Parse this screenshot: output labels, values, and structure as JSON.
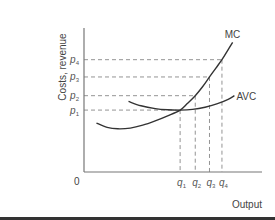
{
  "chart_data": {
    "type": "line",
    "title": "",
    "xlabel": "Output",
    "ylabel": "Costs, revenue",
    "origin_label": "0",
    "grid": false,
    "legend": "none",
    "xlim": [
      0,
      10
    ],
    "ylim": [
      0,
      10
    ],
    "x_ticks": [
      {
        "name": "q",
        "sub": "1",
        "value": 5.4
      },
      {
        "name": "q",
        "sub": "2",
        "value": 6.25
      },
      {
        "name": "q",
        "sub": "3",
        "value": 7.05
      },
      {
        "name": "q",
        "sub": "4",
        "value": 7.75
      }
    ],
    "y_ticks": [
      {
        "name": "p",
        "sub": "1",
        "value": 4.3
      },
      {
        "name": "p",
        "sub": "2",
        "value": 5.3
      },
      {
        "name": "p",
        "sub": "3",
        "value": 6.6
      },
      {
        "name": "p",
        "sub": "4",
        "value": 7.8
      }
    ],
    "series": [
      {
        "name": "MC",
        "label": "MC",
        "points": [
          [
            0.7,
            3.4
          ],
          [
            1.3,
            3.1
          ],
          [
            1.9,
            3.0
          ],
          [
            2.6,
            3.05
          ],
          [
            3.3,
            3.25
          ],
          [
            4.0,
            3.55
          ],
          [
            4.7,
            3.9
          ],
          [
            5.4,
            4.3
          ],
          [
            5.8,
            4.75
          ],
          [
            6.25,
            5.3
          ],
          [
            6.65,
            5.9
          ],
          [
            7.05,
            6.6
          ],
          [
            7.4,
            7.2
          ],
          [
            7.75,
            7.8
          ],
          [
            8.1,
            8.5
          ],
          [
            8.35,
            9.0
          ]
        ]
      },
      {
        "name": "AVC",
        "label": "AVC",
        "points": [
          [
            2.5,
            4.9
          ],
          [
            3.2,
            4.6
          ],
          [
            4.0,
            4.4
          ],
          [
            4.7,
            4.32
          ],
          [
            5.4,
            4.3
          ],
          [
            6.1,
            4.35
          ],
          [
            6.8,
            4.5
          ],
          [
            7.5,
            4.75
          ],
          [
            8.1,
            5.05
          ],
          [
            8.45,
            5.3
          ]
        ]
      }
    ],
    "guides": [
      {
        "from_y": "p1",
        "to_x": "q1"
      },
      {
        "from_y": "p2",
        "to_x": "q2"
      },
      {
        "from_y": "p3",
        "to_x": "q3"
      },
      {
        "from_y": "p4",
        "to_x": "q4"
      }
    ]
  }
}
